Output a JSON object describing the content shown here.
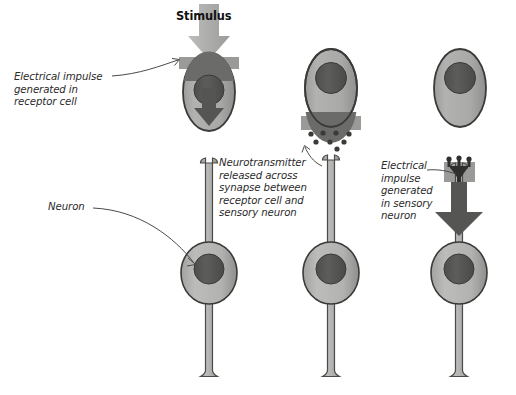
{
  "diagram": {
    "title_label": "Stimulus",
    "labels": {
      "electrical_impulse_receptor": "Electrical impulse\ngenerated in\nreceptor cell",
      "neuron": "Neuron",
      "neurotransmitter": "Neurotransmitter\nreleased across\nsynapse between\nreceptor cell and\nsensory neuron",
      "electrical_impulse_sensory": "Electrical\nimpulse\ngenerated\nin sensory\nneuron"
    },
    "icon_names": {
      "stimulus_arrow": "down-arrow-icon",
      "impulse_arrow_receptor": "down-arrow-icon",
      "impulse_arrow_sensory": "down-arrow-icon",
      "vesicles": "neurotransmitter-vesicle-dots-icon"
    },
    "colors": {
      "background": "#ffffff",
      "cell_body_fill": "#a8a8a6",
      "cell_outline": "#3a3a38",
      "nucleus_fill": "#555553",
      "stimulus_arrow": "#a9a9a7",
      "impulse_arrow": "#5b5b59",
      "synapse_band": "#9a9a98",
      "synapse_band_dark": "#6b6b69",
      "neuron_fill": "#b4b4b2",
      "label_text": "#2b2b2b",
      "title_text": "#111111",
      "leader_line": "#4a4a48"
    },
    "panels": [
      {
        "name": "panel-1-stimulus-received",
        "receptor_cell": true,
        "stimulus_arrow": true,
        "impulse_arrow_in_receptor": true,
        "synapse_vesicles": false,
        "sensory_neuron": true,
        "impulse_arrow_in_neuron": false
      },
      {
        "name": "panel-2-neurotransmitter-release",
        "receptor_cell": true,
        "stimulus_arrow": false,
        "impulse_arrow_in_receptor": false,
        "synapse_vesicles": true,
        "sensory_neuron": true,
        "impulse_arrow_in_neuron": false
      },
      {
        "name": "panel-3-impulse-in-sensory-neuron",
        "receptor_cell": true,
        "stimulus_arrow": false,
        "impulse_arrow_in_receptor": false,
        "synapse_vesicles": false,
        "sensory_neuron": true,
        "impulse_arrow_in_neuron": true
      }
    ]
  }
}
